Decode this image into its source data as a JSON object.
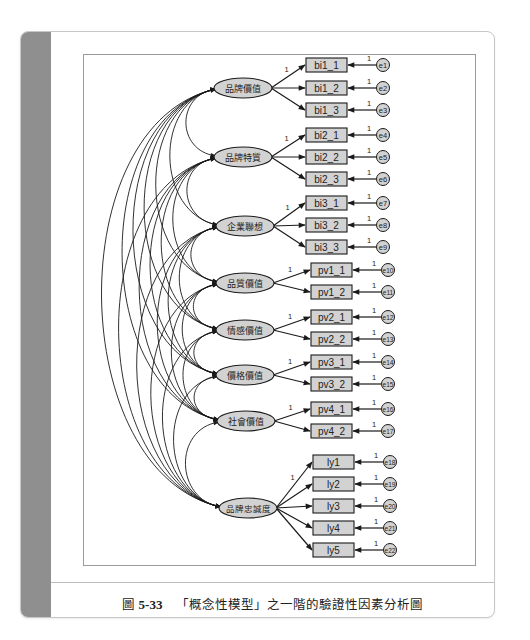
{
  "figure": {
    "caption_label": "圖",
    "caption_number": "5-33",
    "caption_text": "「概念性模型」之一階的驗證性因素分析圖"
  },
  "colors": {
    "side_bar": "#8f8f8f",
    "latent_fill": "#d2d2d2",
    "observed_fill": "#d2d2d2",
    "error_fill": "#d2d2d2",
    "stroke": "#1a1a1a"
  },
  "diagram": {
    "type": "confirmatory-factor-analysis",
    "fixed_loading_label": "1",
    "error_path_label": "1",
    "latents": [
      {
        "name": "品牌價值",
        "cx": 243,
        "cy": 88,
        "indicators": [
          {
            "name": "bi1_1",
            "cy": 65,
            "error": "e1"
          },
          {
            "name": "bi1_2",
            "cy": 88,
            "error": "e2"
          },
          {
            "name": "bi1_3",
            "cy": 110,
            "error": "e3"
          }
        ]
      },
      {
        "name": "品牌特質",
        "cx": 243,
        "cy": 157,
        "indicators": [
          {
            "name": "bi2_1",
            "cy": 135,
            "error": "e4"
          },
          {
            "name": "bi2_2",
            "cy": 157,
            "error": "e5"
          },
          {
            "name": "bi2_3",
            "cy": 179,
            "error": "e6"
          }
        ]
      },
      {
        "name": "企業聯想",
        "cx": 245,
        "cy": 226,
        "indicators": [
          {
            "name": "bi3_1",
            "cy": 203,
            "error": "e7"
          },
          {
            "name": "bi3_2",
            "cy": 225,
            "error": "e8"
          },
          {
            "name": "bi3_3",
            "cy": 247,
            "error": "e9"
          }
        ]
      },
      {
        "name": "品質價值",
        "cx": 245,
        "cy": 283,
        "indicators": [
          {
            "name": "pv1_1",
            "cy": 270,
            "error": "e10"
          },
          {
            "name": "pv1_2",
            "cy": 292,
            "error": "e11"
          }
        ]
      },
      {
        "name": "情感價值",
        "cx": 245,
        "cy": 330,
        "indicators": [
          {
            "name": "pv2_1",
            "cy": 317,
            "error": "e12"
          },
          {
            "name": "pv2_2",
            "cy": 339,
            "error": "e13"
          }
        ]
      },
      {
        "name": "價格價值",
        "cx": 245,
        "cy": 375,
        "indicators": [
          {
            "name": "pv3_1",
            "cy": 362,
            "error": "e14"
          },
          {
            "name": "pv3_2",
            "cy": 384,
            "error": "e15"
          }
        ]
      },
      {
        "name": "社會價值",
        "cx": 246,
        "cy": 421,
        "indicators": [
          {
            "name": "pv4_1",
            "cy": 409,
            "error": "e16"
          },
          {
            "name": "pv4_2",
            "cy": 431,
            "error": "e17"
          }
        ]
      },
      {
        "name": "品牌忠誠度",
        "cx": 248,
        "cy": 508,
        "indicators": [
          {
            "name": "ly1",
            "cy": 462,
            "error": "e18"
          },
          {
            "name": "ly2",
            "cy": 484,
            "error": "e19"
          },
          {
            "name": "ly3",
            "cy": 506,
            "error": "e20"
          },
          {
            "name": "ly4",
            "cy": 528,
            "error": "e21"
          },
          {
            "name": "ly5",
            "cy": 550,
            "error": "e22"
          }
        ]
      }
    ],
    "covariances": "all latent pairs (28 curved double-headed arrows)"
  }
}
